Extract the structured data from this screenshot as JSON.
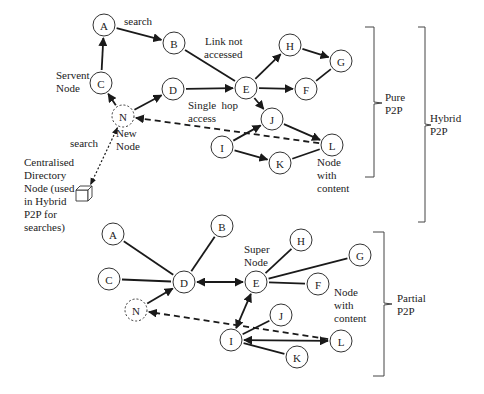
{
  "pure": {
    "nodes": [
      {
        "id": "A",
        "label": "A"
      },
      {
        "id": "B",
        "label": "B"
      },
      {
        "id": "C",
        "label": "C"
      },
      {
        "id": "N",
        "label": "N",
        "style": "dashed"
      },
      {
        "id": "D",
        "label": "D"
      },
      {
        "id": "E",
        "label": "E"
      },
      {
        "id": "H",
        "label": "H"
      },
      {
        "id": "G",
        "label": "G"
      },
      {
        "id": "F",
        "label": "F"
      },
      {
        "id": "J",
        "label": "J"
      },
      {
        "id": "I",
        "label": "I"
      },
      {
        "id": "K",
        "label": "K"
      },
      {
        "id": "L",
        "label": "L"
      }
    ],
    "edges": [
      {
        "from": "C",
        "to": "A",
        "type": "arrow"
      },
      {
        "from": "A",
        "to": "B",
        "type": "arrow"
      },
      {
        "from": "B",
        "to": "E",
        "type": "line"
      },
      {
        "from": "N",
        "to": "C",
        "type": "arrow"
      },
      {
        "from": "N",
        "to": "D",
        "type": "arrow"
      },
      {
        "from": "D",
        "to": "E",
        "type": "arrow"
      },
      {
        "from": "E",
        "to": "H",
        "type": "arrow"
      },
      {
        "from": "H",
        "to": "G",
        "type": "arrow"
      },
      {
        "from": "E",
        "to": "F",
        "type": "arrow"
      },
      {
        "from": "F",
        "to": "G",
        "type": "line"
      },
      {
        "from": "E",
        "to": "J",
        "type": "arrow"
      },
      {
        "from": "J",
        "to": "L",
        "type": "arrow"
      },
      {
        "from": "I",
        "to": "J",
        "type": "arrow"
      },
      {
        "from": "I",
        "to": "K",
        "type": "arrow"
      },
      {
        "from": "K",
        "to": "L",
        "type": "line"
      },
      {
        "from": "L",
        "to": "N",
        "type": "dashed-arrow"
      },
      {
        "from": "N",
        "to": "Dir",
        "type": "dotted-double-arrow"
      }
    ],
    "labels": {
      "search_top": "search",
      "servent_node": [
        "Servent",
        "Node"
      ],
      "new_node": [
        "New",
        "Node"
      ],
      "link_not_accessed": [
        "Link not",
        "accessed"
      ],
      "single_hop": [
        "Single  hop",
        "access"
      ],
      "node_with_content": [
        "Node",
        "with",
        "content"
      ],
      "search_dir": "search",
      "directory": [
        "Centralised",
        "Directory",
        "Node (used",
        "in Hybrid",
        "P2P for",
        "searches)"
      ]
    }
  },
  "partial": {
    "nodes": [
      {
        "id": "A",
        "label": "A"
      },
      {
        "id": "B",
        "label": "B"
      },
      {
        "id": "C",
        "label": "C"
      },
      {
        "id": "N",
        "label": "N",
        "style": "dashed"
      },
      {
        "id": "D",
        "label": "D"
      },
      {
        "id": "E",
        "label": "E"
      },
      {
        "id": "H",
        "label": "H"
      },
      {
        "id": "G",
        "label": "G"
      },
      {
        "id": "F",
        "label": "F"
      },
      {
        "id": "J",
        "label": "J"
      },
      {
        "id": "I",
        "label": "I"
      },
      {
        "id": "K",
        "label": "K"
      },
      {
        "id": "L",
        "label": "L"
      }
    ],
    "edges": [
      {
        "from": "A",
        "to": "D",
        "type": "line"
      },
      {
        "from": "B",
        "to": "D",
        "type": "line"
      },
      {
        "from": "C",
        "to": "D",
        "type": "line"
      },
      {
        "from": "N",
        "to": "D",
        "type": "arrow"
      },
      {
        "from": "D",
        "to": "E",
        "type": "double-arrow"
      },
      {
        "from": "E",
        "to": "H",
        "type": "line"
      },
      {
        "from": "E",
        "to": "G",
        "type": "line"
      },
      {
        "from": "E",
        "to": "F",
        "type": "line"
      },
      {
        "from": "E",
        "to": "I",
        "type": "double-arrow"
      },
      {
        "from": "I",
        "to": "J",
        "type": "line"
      },
      {
        "from": "I",
        "to": "L",
        "type": "double-arrow"
      },
      {
        "from": "I",
        "to": "K",
        "type": "line"
      },
      {
        "from": "L",
        "to": "N",
        "type": "dashed-arrow"
      }
    ],
    "labels": {
      "super_node": [
        "Super",
        "Node"
      ],
      "node_with_content": [
        "Node",
        "with",
        "content"
      ]
    }
  },
  "braces": {
    "pure": [
      "Pure",
      "P2P"
    ],
    "hybrid": [
      "Hybrid",
      "P2P"
    ],
    "partial": [
      "Partial",
      "P2P"
    ]
  }
}
